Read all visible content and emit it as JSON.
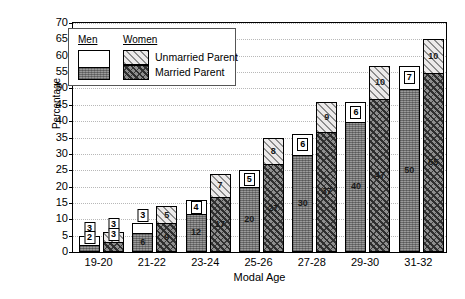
{
  "chart_data": {
    "type": "bar",
    "subtype": "grouped-stacked",
    "title": "",
    "xlabel": "Modal Age",
    "ylabel": "Percentage",
    "ylim": [
      0,
      70
    ],
    "ytick_step": 5,
    "yticks": [
      70,
      65,
      60,
      55,
      50,
      45,
      40,
      35,
      30,
      25,
      20,
      15,
      10,
      5,
      0
    ],
    "grid": true,
    "legend_position": "top-left-inside",
    "categories": [
      "19-20",
      "21-22",
      "23-24",
      "25-26",
      "27-28",
      "29-30",
      "31-32"
    ],
    "groups": [
      "Men",
      "Women"
    ],
    "stack_order_bottom_to_top": [
      "Married Parent",
      "Unmarried Parent"
    ],
    "series": [
      {
        "name": "Men - Married Parent",
        "group": "Men",
        "segment": "Married Parent",
        "values": [
          2,
          6,
          12,
          20,
          30,
          40,
          50
        ]
      },
      {
        "name": "Men - Unmarried Parent",
        "group": "Men",
        "segment": "Unmarried Parent",
        "values": [
          3,
          3,
          4,
          5,
          6,
          6,
          7
        ]
      },
      {
        "name": "Women - Married Parent",
        "group": "Women",
        "segment": "Married Parent",
        "values": [
          3,
          9,
          17,
          27,
          37,
          47,
          55
        ]
      },
      {
        "name": "Women - Unmarried Parent",
        "group": "Women",
        "segment": "Unmarried Parent",
        "values": [
          3,
          5,
          7,
          8,
          9,
          10,
          10
        ]
      }
    ],
    "totals": {
      "men": [
        5,
        9,
        16,
        25,
        36,
        46,
        57
      ],
      "women": [
        6,
        14,
        24,
        35,
        46,
        57,
        65
      ]
    }
  },
  "legend": {
    "header_men": "Men",
    "header_women": "Women",
    "unmarried_label": "Unmarried Parent",
    "married_label": "Married Parent"
  },
  "colors": {
    "men_unmarried": "#ffffff",
    "men_married": "#9a9a9a",
    "women_unmarried": "#eceaea",
    "women_married": "#8e8e8e",
    "axis": "#000000",
    "gridline": "#b8b8b8"
  }
}
